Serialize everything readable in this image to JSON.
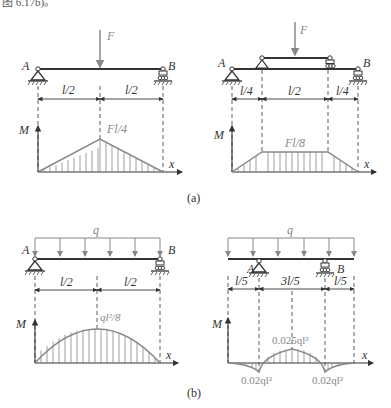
{
  "header_fragment": "图 6.17b)。",
  "figures": {
    "a": {
      "caption": "(a)",
      "left": {
        "load_label": "F",
        "support_a": "A",
        "support_b": "B",
        "dims": [
          "l/2",
          "l/2"
        ],
        "axis_m": "M",
        "axis_x": "x",
        "peak_label": "Fl/4"
      },
      "right": {
        "load_label": "F",
        "support_a": "A",
        "support_b": "B",
        "dims": [
          "l/4",
          "l/2",
          "l/4"
        ],
        "axis_m": "M",
        "axis_x": "x",
        "peak_label": "Fl/8"
      }
    },
    "b": {
      "caption": "(b)",
      "left": {
        "load_label": "q",
        "support_a": "A",
        "support_b": "B",
        "dims": [
          "l/2",
          "l/2"
        ],
        "axis_m": "M",
        "axis_x": "x",
        "peak_label": "ql²/8"
      },
      "right": {
        "load_label": "q",
        "support_a": "A",
        "support_b": "B",
        "dims": [
          "l/5",
          "3l/5",
          "l/5"
        ],
        "axis_m": "M",
        "axis_x": "x",
        "peak_label": "0.025ql²",
        "neg_left_label": "0.02ql²",
        "neg_right_label": "0.02ql²"
      }
    }
  },
  "colors": {
    "line": "#333333",
    "diagram": "#888888",
    "hatch": "#777777"
  }
}
